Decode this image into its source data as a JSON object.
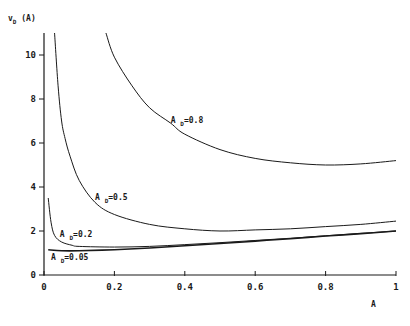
{
  "chart_data": {
    "type": "line",
    "title": "",
    "xlabel": "A",
    "ylabel": "v_D (A)",
    "ylabel_parts": {
      "main": "v",
      "sub": "D",
      "rest": " (A)"
    },
    "xlim": [
      0,
      1
    ],
    "ylim": [
      0,
      11
    ],
    "x_ticks": [
      0,
      0.2,
      0.4,
      0.6,
      0.8,
      1
    ],
    "x_tick_labels": [
      "0",
      "0.2",
      "0.4",
      "0.6",
      "0.8",
      "1"
    ],
    "y_ticks": [
      0,
      2,
      4,
      6,
      8,
      10
    ],
    "y_tick_labels": [
      "0",
      "2",
      "4",
      "6",
      "8",
      "10"
    ],
    "grid": false,
    "legend": "inline labels",
    "series": [
      {
        "name": "A_D=0.8",
        "label_main": "A",
        "label_sub": "D",
        "label_rest": "=0.8",
        "label_pos": [
          0.36,
          6.9
        ],
        "stroke_width": 1,
        "points": [
          [
            0.176,
            11.0
          ],
          [
            0.2,
            9.9
          ],
          [
            0.25,
            8.6
          ],
          [
            0.3,
            7.6
          ],
          [
            0.36,
            6.9
          ],
          [
            0.4,
            6.4
          ],
          [
            0.5,
            5.7
          ],
          [
            0.6,
            5.3
          ],
          [
            0.7,
            5.1
          ],
          [
            0.8,
            5.0
          ],
          [
            0.9,
            5.05
          ],
          [
            1.0,
            5.2
          ]
        ]
      },
      {
        "name": "A_D=0.5",
        "label_main": "A",
        "label_sub": "D",
        "label_rest": "=0.5",
        "label_pos": [
          0.145,
          3.4
        ],
        "stroke_width": 1,
        "points": [
          [
            0.03,
            11.0
          ],
          [
            0.04,
            8.6
          ],
          [
            0.05,
            7.0
          ],
          [
            0.06,
            6.2
          ],
          [
            0.074,
            5.4
          ],
          [
            0.1,
            4.3
          ],
          [
            0.145,
            3.3
          ],
          [
            0.2,
            2.75
          ],
          [
            0.3,
            2.3
          ],
          [
            0.4,
            2.1
          ],
          [
            0.5,
            2.0
          ],
          [
            0.6,
            2.05
          ],
          [
            0.7,
            2.1
          ],
          [
            0.8,
            2.2
          ],
          [
            0.9,
            2.3
          ],
          [
            1.0,
            2.45
          ]
        ]
      },
      {
        "name": "A_D=0.2",
        "label_main": "A",
        "label_sub": "D",
        "label_rest": "=0.2",
        "label_pos": [
          0.045,
          1.75
        ],
        "stroke_width": 1,
        "points": [
          [
            0.012,
            3.5
          ],
          [
            0.02,
            2.4
          ],
          [
            0.03,
            1.8
          ],
          [
            0.05,
            1.5
          ],
          [
            0.08,
            1.35
          ],
          [
            0.1,
            1.3
          ],
          [
            0.2,
            1.27
          ],
          [
            0.3,
            1.3
          ],
          [
            0.4,
            1.38
          ],
          [
            0.5,
            1.47
          ],
          [
            0.6,
            1.57
          ],
          [
            0.7,
            1.67
          ],
          [
            0.8,
            1.78
          ],
          [
            0.9,
            1.89
          ],
          [
            1.0,
            2.0
          ]
        ]
      },
      {
        "name": "A_D=0.05",
        "label_main": "A",
        "label_sub": "D",
        "label_rest": "=0.05",
        "label_pos": [
          0.02,
          0.7
        ],
        "stroke_width": 1.6,
        "points": [
          [
            0.012,
            1.15
          ],
          [
            0.05,
            1.1
          ],
          [
            0.1,
            1.1
          ],
          [
            0.2,
            1.15
          ],
          [
            0.3,
            1.23
          ],
          [
            0.4,
            1.33
          ],
          [
            0.5,
            1.43
          ],
          [
            0.6,
            1.54
          ],
          [
            0.7,
            1.65
          ],
          [
            0.8,
            1.77
          ],
          [
            0.9,
            1.88
          ],
          [
            1.0,
            2.0
          ]
        ]
      }
    ]
  },
  "layout": {
    "plot_left": 44,
    "plot_right": 396,
    "plot_bottom": 275,
    "px_per_y_unit": 22
  }
}
